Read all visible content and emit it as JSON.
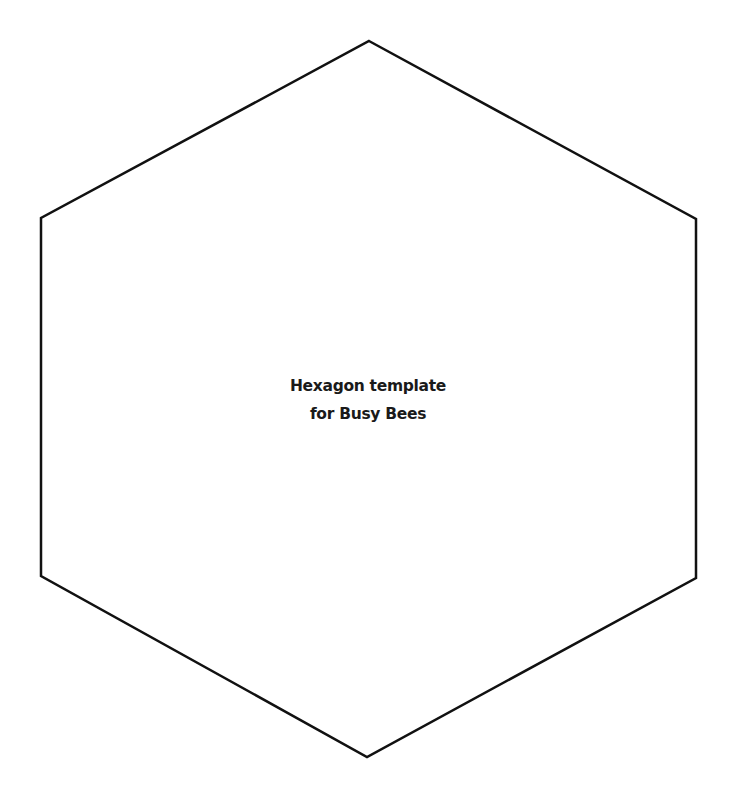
{
  "document": {
    "title_line_1": "Hexagon template",
    "title_line_2": "for Busy Bees"
  },
  "shape": {
    "type": "hexagon",
    "stroke_color": "#111111",
    "fill_color": "#ffffff",
    "stroke_width": 2.5,
    "points": "369,41 696,219 696,578 367,757 41,576 41,218"
  },
  "colors": {
    "background": "#ffffff",
    "text": "#1a1a1a"
  }
}
